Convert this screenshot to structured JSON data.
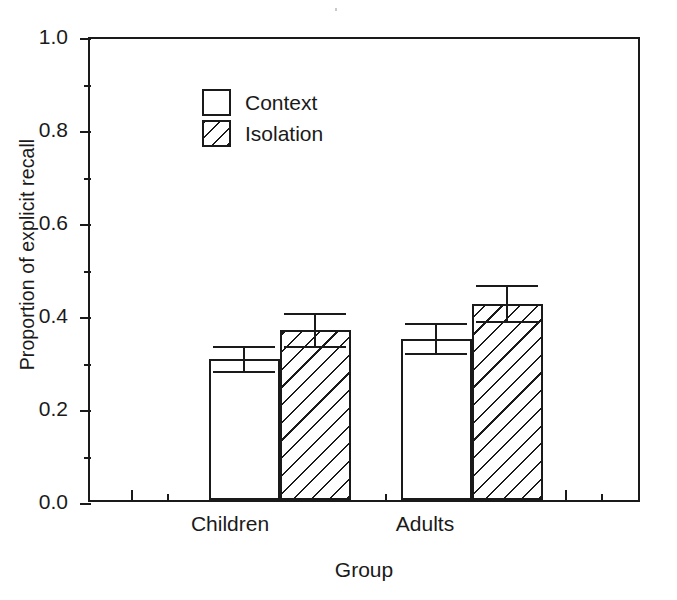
{
  "chart_data": {
    "type": "bar",
    "title": "",
    "xlabel": "Group",
    "ylabel": "Proportion of explicit recall",
    "categories": [
      "Children",
      "Adults"
    ],
    "series": [
      {
        "name": "Context",
        "fill": "white",
        "values": [
          0.305,
          0.35
        ],
        "errors": [
          0.03,
          0.035
        ]
      },
      {
        "name": "Isolation",
        "fill": "hatched",
        "values": [
          0.368,
          0.425
        ],
        "errors": [
          0.038,
          0.042
        ]
      }
    ],
    "ylim": [
      0.0,
      1.0
    ],
    "yticks": [
      0.0,
      0.2,
      0.4,
      0.6,
      0.8,
      1.0
    ],
    "ytick_labels": [
      "0.0",
      "0.2",
      "0.4",
      "0.6",
      "0.8",
      "1.0"
    ],
    "yminor_ticks": [
      0.1,
      0.3,
      0.5,
      0.7,
      0.9
    ],
    "grid": false,
    "legend_position": "top-left",
    "error_bar_type": "standard error",
    "colors": {
      "ink": "#1a1a1a",
      "background": "#ffffff"
    }
  },
  "axes": {
    "y_title": "Proportion of explicit recall",
    "x_title": "Group",
    "y_labels": [
      "1.0",
      "0.8",
      "0.6",
      "0.4",
      "0.2",
      "0.0"
    ],
    "x_labels": [
      "Children",
      "Adults"
    ]
  },
  "legend": {
    "items": [
      {
        "label": "Context",
        "swatch": "open-square-swatch"
      },
      {
        "label": "Isolation",
        "swatch": "hatched-square-swatch"
      }
    ]
  },
  "caption_fragment": {
    "text": ""
  }
}
